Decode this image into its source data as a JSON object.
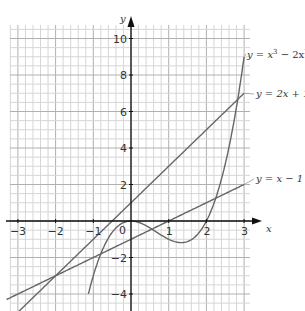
{
  "chart_data": {
    "type": "line",
    "title": "",
    "xlabel": "x",
    "ylabel": "y",
    "xlim": [
      -3.3,
      3.4
    ],
    "ylim": [
      -5,
      10.8
    ],
    "grid": true,
    "x_ticks": [
      -3,
      -2,
      -1,
      0,
      1,
      2,
      3
    ],
    "x_tick_labels": [
      "−3",
      "−2",
      "−1",
      "0",
      "1",
      "2",
      "3"
    ],
    "y_ticks": [
      -4,
      -2,
      2,
      4,
      6,
      8,
      10
    ],
    "y_tick_labels": [
      "−4",
      "−2",
      "2",
      "4",
      "6",
      "8",
      "10"
    ],
    "series": [
      {
        "name": "y = x³ − 2x²",
        "label_main": "y = x",
        "label_sup1": "3",
        "label_mid": " − 2x",
        "label_sup2": "2",
        "expr": "x^3-2x^2",
        "x_range": [
          -1.13,
          3
        ]
      },
      {
        "name": "y = 2x + 1",
        "label": "y = 2x + 1",
        "expr": "2x+1",
        "x_range": [
          -3,
          3
        ]
      },
      {
        "name": "y = x − 1",
        "label": "y = x − 1",
        "expr": "x-1",
        "x_range": [
          -3.3,
          3
        ]
      }
    ],
    "intersections": [
      {
        "x": -2,
        "y": -3,
        "of": [
          "y = 2x + 1",
          "y = x − 1"
        ]
      },
      {
        "x": -0.7,
        "y": -1.7,
        "of": [
          "y = x³ − 2x²",
          "y = x − 1"
        ]
      },
      {
        "x": 2.2,
        "y": 1.2,
        "of": [
          "y = x³ − 2x²",
          "y = x − 1"
        ]
      },
      {
        "x": 2.7,
        "y": 6.4,
        "of": [
          "y = x³ − 2x²",
          "y = 2x + 1"
        ]
      }
    ],
    "colors": {
      "curve": "#666666",
      "axis": "#111111",
      "grid_minor": "#d6d6d6",
      "grid_major": "#b0b0b0"
    }
  },
  "axes": {
    "x_name": "x",
    "y_name": "y",
    "origin_label": "0"
  }
}
